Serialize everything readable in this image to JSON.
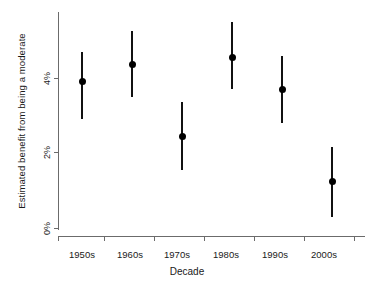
{
  "chart_data": {
    "type": "scatter",
    "title": "",
    "subtitle": "",
    "xlabel": "Decade",
    "ylabel": "Estimated benefit from being a moderate",
    "categories": [
      "1950s",
      "1960s",
      "1970s",
      "1980s",
      "1990s",
      "2000s"
    ],
    "values": [
      3.9,
      4.35,
      2.45,
      4.55,
      3.7,
      1.25
    ],
    "error_low": [
      2.9,
      3.5,
      1.55,
      3.7,
      2.8,
      0.3
    ],
    "error_high": [
      4.7,
      5.25,
      3.35,
      5.5,
      4.6,
      2.15
    ],
    "series": [
      {
        "name": "Estimated benefit from being a moderate",
        "values": [
          3.9,
          4.35,
          2.45,
          4.55,
          3.7,
          1.25
        ],
        "error_low": [
          2.9,
          3.5,
          1.55,
          3.7,
          2.8,
          0.3
        ],
        "error_high": [
          4.7,
          5.25,
          3.35,
          5.5,
          4.6,
          2.15
        ]
      }
    ],
    "ytick_values": [
      0,
      2,
      4
    ],
    "ytick_labels": [
      "0%",
      "2%",
      "4%"
    ],
    "ylim": [
      0,
      6
    ],
    "xlim": [
      0,
      7
    ],
    "grid": false,
    "legend": null,
    "legend_position": "none",
    "marker": "filled-circle",
    "error_bar_style": "vertical-line-no-caps",
    "colors": {
      "marker": "#000000",
      "error_bar": "#111111",
      "axis": "#6b6b6b",
      "text": "#1a1a1a",
      "background": "#ffffff"
    }
  },
  "axes": {
    "y_title": "Estimated benefit from being a moderate",
    "x_title": "Decade",
    "y_ticks": [
      {
        "label": "0%",
        "value": 0
      },
      {
        "label": "2%",
        "value": 2
      },
      {
        "label": "4%",
        "value": 4
      }
    ],
    "x_ticks": [
      {
        "label": "1950s"
      },
      {
        "label": "1960s"
      },
      {
        "label": "1970s"
      },
      {
        "label": "1980s"
      },
      {
        "label": "1990s"
      },
      {
        "label": "2000s"
      }
    ]
  }
}
